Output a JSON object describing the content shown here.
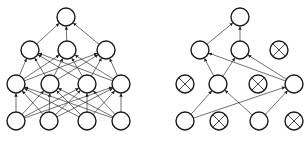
{
  "diagram": {
    "node_radius": 9,
    "colors": {
      "node_stroke": "#1a1a1a",
      "edge": "#333333",
      "background": "#ffffff"
    },
    "networks": [
      {
        "name": "standard-neural-net",
        "nodes": [
          {
            "id": "L_o",
            "x": 66,
            "y": 17,
            "dropped": false
          },
          {
            "id": "L_h2a",
            "x": 30,
            "y": 50,
            "dropped": false
          },
          {
            "id": "L_h2b",
            "x": 67,
            "y": 50,
            "dropped": false
          },
          {
            "id": "L_h2c",
            "x": 106,
            "y": 50,
            "dropped": false
          },
          {
            "id": "L_h1a",
            "x": 16,
            "y": 84,
            "dropped": false
          },
          {
            "id": "L_h1b",
            "x": 50,
            "y": 84,
            "dropped": false
          },
          {
            "id": "L_h1c",
            "x": 87,
            "y": 84,
            "dropped": false
          },
          {
            "id": "L_h1d",
            "x": 121,
            "y": 84,
            "dropped": false
          },
          {
            "id": "L_ia",
            "x": 16,
            "y": 121,
            "dropped": false
          },
          {
            "id": "L_ib",
            "x": 49,
            "y": 121,
            "dropped": false
          },
          {
            "id": "L_ic",
            "x": 87,
            "y": 121,
            "dropped": false
          },
          {
            "id": "L_id",
            "x": 121,
            "y": 121,
            "dropped": false
          }
        ],
        "edges": [
          [
            "L_h2a",
            "L_o"
          ],
          [
            "L_h2b",
            "L_o"
          ],
          [
            "L_h2c",
            "L_o"
          ],
          [
            "L_h1a",
            "L_h2a"
          ],
          [
            "L_h1a",
            "L_h2b"
          ],
          [
            "L_h1a",
            "L_h2c"
          ],
          [
            "L_h1b",
            "L_h2a"
          ],
          [
            "L_h1b",
            "L_h2b"
          ],
          [
            "L_h1b",
            "L_h2c"
          ],
          [
            "L_h1c",
            "L_h2a"
          ],
          [
            "L_h1c",
            "L_h2b"
          ],
          [
            "L_h1c",
            "L_h2c"
          ],
          [
            "L_h1d",
            "L_h2a"
          ],
          [
            "L_h1d",
            "L_h2b"
          ],
          [
            "L_h1d",
            "L_h2c"
          ],
          [
            "L_ia",
            "L_h1a"
          ],
          [
            "L_ia",
            "L_h1b"
          ],
          [
            "L_ia",
            "L_h1c"
          ],
          [
            "L_ia",
            "L_h1d"
          ],
          [
            "L_ib",
            "L_h1a"
          ],
          [
            "L_ib",
            "L_h1b"
          ],
          [
            "L_ib",
            "L_h1c"
          ],
          [
            "L_ib",
            "L_h1d"
          ],
          [
            "L_ic",
            "L_h1a"
          ],
          [
            "L_ic",
            "L_h1b"
          ],
          [
            "L_ic",
            "L_h1c"
          ],
          [
            "L_ic",
            "L_h1d"
          ],
          [
            "L_id",
            "L_h1a"
          ],
          [
            "L_id",
            "L_h1b"
          ],
          [
            "L_id",
            "L_h1c"
          ],
          [
            "L_id",
            "L_h1d"
          ]
        ]
      },
      {
        "name": "after-dropout-net",
        "nodes": [
          {
            "id": "R_o",
            "x": 240,
            "y": 17,
            "dropped": false
          },
          {
            "id": "R_h2a",
            "x": 200,
            "y": 50,
            "dropped": false
          },
          {
            "id": "R_h2b",
            "x": 240,
            "y": 50,
            "dropped": false
          },
          {
            "id": "R_h2c",
            "x": 279,
            "y": 50,
            "dropped": true
          },
          {
            "id": "R_h1a",
            "x": 185,
            "y": 84,
            "dropped": true
          },
          {
            "id": "R_h1b",
            "x": 218,
            "y": 84,
            "dropped": false
          },
          {
            "id": "R_h1c",
            "x": 258,
            "y": 84,
            "dropped": true
          },
          {
            "id": "R_h1d",
            "x": 294,
            "y": 84,
            "dropped": false
          },
          {
            "id": "R_ia",
            "x": 185,
            "y": 121,
            "dropped": false
          },
          {
            "id": "R_ib",
            "x": 219,
            "y": 121,
            "dropped": true
          },
          {
            "id": "R_ic",
            "x": 259,
            "y": 121,
            "dropped": false
          },
          {
            "id": "R_id",
            "x": 294,
            "y": 121,
            "dropped": true
          }
        ],
        "edges": [
          [
            "R_h2a",
            "R_o"
          ],
          [
            "R_h2b",
            "R_o"
          ],
          [
            "R_h1b",
            "R_h2a"
          ],
          [
            "R_h1b",
            "R_h2b"
          ],
          [
            "R_h1d",
            "R_h2a"
          ],
          [
            "R_h1d",
            "R_h2b"
          ],
          [
            "R_ia",
            "R_h1b"
          ],
          [
            "R_ia",
            "R_h1d"
          ],
          [
            "R_ic",
            "R_h1b"
          ],
          [
            "R_ic",
            "R_h1d"
          ]
        ]
      }
    ]
  }
}
